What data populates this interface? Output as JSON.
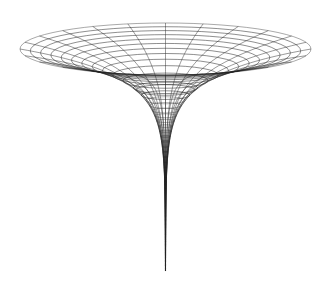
{
  "figure": {
    "background": "#ffffff",
    "line_color": "#222222",
    "rim_color": "#555555",
    "center_x": 165.5,
    "rim_center_y": 49,
    "rim_half_width": 145.5,
    "rim_half_height": 26,
    "depth_scale": 25.7,
    "profile": "log",
    "ring_count": 48,
    "r_min": 0.00018,
    "meridian_count": 24,
    "tip_y": 270
  }
}
